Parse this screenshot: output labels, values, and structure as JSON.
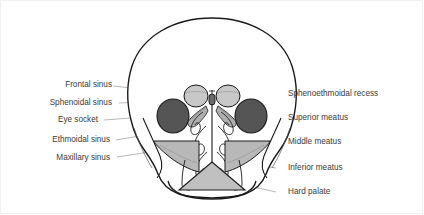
{
  "diagram": {
    "colors": {
      "outline": "#1a1a1a",
      "leader_line": "#9a9a9a",
      "label_text": "#3a3a3a",
      "background": "#ffffff",
      "eye_socket_fill": "#555555",
      "frontal_sinus_fill": "#c8c8c8",
      "sphenoidal_sinus_fill": "#6a6a6a",
      "maxillary_sinus_fill": "#b8b8b8",
      "hard_palate_fill": "#c0c0c0",
      "bone_fill": "#ffffff"
    },
    "labels_left": [
      {
        "id": "frontal-sinus",
        "text": "Frontal sinus"
      },
      {
        "id": "sphenoidal-sinus",
        "text": "Sphenoidal sinus"
      },
      {
        "id": "eye-socket",
        "text": "Eye socket"
      },
      {
        "id": "ethmoidal-sinus",
        "text": "Ethmoidal sinus"
      },
      {
        "id": "maxillary-sinus",
        "text": "Maxillary sinus"
      }
    ],
    "labels_right": [
      {
        "id": "sphenoethmoidal-recess",
        "text": "Sphenoethmoidal recess"
      },
      {
        "id": "superior-meatus",
        "text": "Superior meatus"
      },
      {
        "id": "middle-meatus",
        "text": "Middle meatus"
      },
      {
        "id": "inferior-meatus",
        "text": "Inferior meatus"
      },
      {
        "id": "hard-palate",
        "text": "Hard palate"
      }
    ],
    "structures": [
      {
        "id": "cranium",
        "name": "cranial vault outline"
      },
      {
        "id": "frontal-sinus-left",
        "name": "left frontal sinus"
      },
      {
        "id": "frontal-sinus-right",
        "name": "right frontal sinus"
      },
      {
        "id": "sphenoidal-sinus",
        "name": "sphenoidal sinus"
      },
      {
        "id": "eye-socket-left",
        "name": "left orbit"
      },
      {
        "id": "eye-socket-right",
        "name": "right orbit"
      },
      {
        "id": "ethmoidal-sinus",
        "name": "ethmoidal air cells"
      },
      {
        "id": "maxillary-sinus-left",
        "name": "left maxillary sinus"
      },
      {
        "id": "maxillary-sinus-right",
        "name": "right maxillary sinus"
      },
      {
        "id": "nasal-septum",
        "name": "nasal septum"
      },
      {
        "id": "superior-concha",
        "name": "superior nasal concha"
      },
      {
        "id": "middle-concha",
        "name": "middle nasal concha"
      },
      {
        "id": "inferior-concha",
        "name": "inferior nasal concha"
      },
      {
        "id": "hard-palate",
        "name": "hard palate"
      }
    ]
  }
}
